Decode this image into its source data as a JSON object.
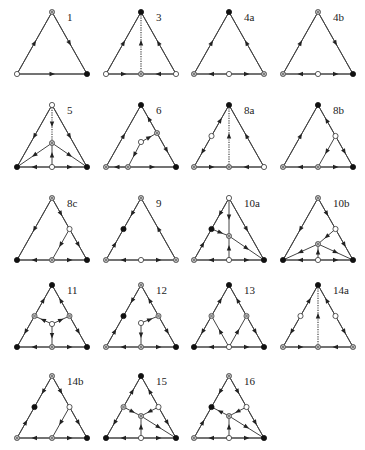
{
  "figure": {
    "legend": {
      "black": "filled circle",
      "white": "open circle",
      "gray": "crossed/shaded circle"
    },
    "colors": {
      "edge": "#444444",
      "black": "#111111",
      "white": "#ffffff",
      "gray": "#bbbbbb"
    },
    "layout": {
      "col_apex_x": [
        52,
        141,
        229,
        318
      ],
      "row_apex_y": [
        12,
        105,
        198,
        285,
        376
      ],
      "half_width": 35,
      "height": 62
    },
    "named_points": {
      "A": [
        0,
        0
      ],
      "L": [
        -35,
        62
      ],
      "R": [
        35,
        62
      ],
      "BM": [
        0,
        62
      ],
      "LM": [
        -17.5,
        31
      ],
      "RM": [
        17.5,
        31
      ]
    },
    "diagrams": [
      {
        "label": "1",
        "row": 0,
        "col": 0,
        "nodes": {
          "A": "gray",
          "L": "white",
          "R": "black"
        },
        "edges": [
          [
            "L",
            "A",
            false
          ],
          [
            "A",
            "R",
            false
          ],
          [
            "L",
            "R",
            false
          ]
        ]
      },
      {
        "label": "3",
        "row": 0,
        "col": 1,
        "nodes": {
          "A": "black",
          "L": "white",
          "R": "white",
          "BM": "gray"
        },
        "edges": [
          [
            "L",
            "A",
            false
          ],
          [
            "R",
            "A",
            false
          ],
          [
            "L",
            "BM",
            false
          ],
          [
            "R",
            "BM",
            false
          ],
          [
            "BM",
            "A",
            true
          ]
        ]
      },
      {
        "label": "4a",
        "row": 0,
        "col": 2,
        "nodes": {
          "A": "black",
          "L": "gray",
          "R": "gray",
          "BM": "white"
        },
        "edges": [
          [
            "L",
            "A",
            false
          ],
          [
            "R",
            "A",
            false
          ],
          [
            "BM",
            "L",
            false
          ],
          [
            "BM",
            "R",
            false
          ]
        ]
      },
      {
        "label": "4b",
        "row": 0,
        "col": 3,
        "nodes": {
          "A": "gray",
          "L": "gray",
          "R": "black",
          "BM": "white"
        },
        "edges": [
          [
            "L",
            "A",
            false
          ],
          [
            "A",
            "R",
            false
          ],
          [
            "BM",
            "L",
            false
          ],
          [
            "BM",
            "R",
            false
          ]
        ]
      },
      {
        "label": "5",
        "row": 1,
        "col": 0,
        "nodes": {
          "A": "white",
          "L": "black",
          "R": "black",
          "BM": "white",
          "C": "gray"
        },
        "points": {
          "C": [
            0,
            38
          ]
        },
        "edges": [
          [
            "A",
            "L",
            false
          ],
          [
            "A",
            "R",
            false
          ],
          [
            "BM",
            "L",
            false
          ],
          [
            "BM",
            "R",
            false
          ],
          [
            "A",
            "C",
            true
          ],
          [
            "BM",
            "C",
            false
          ],
          [
            "C",
            "L",
            false
          ],
          [
            "C",
            "R",
            false
          ]
        ]
      },
      {
        "label": "6",
        "row": 1,
        "col": 1,
        "nodes": {
          "A": "black",
          "L": "gray",
          "R": "black",
          "P": "gray",
          "Q": "white",
          "S": "gray"
        },
        "points": {
          "P": [
            16,
            28
          ],
          "Q": [
            0,
            37
          ],
          "S": [
            -13,
            62
          ]
        },
        "edges": [
          [
            "L",
            "A",
            false
          ],
          [
            "P",
            "A",
            false
          ],
          [
            "P",
            "R",
            false
          ],
          [
            "S",
            "L",
            false
          ],
          [
            "S",
            "R",
            false
          ],
          [
            "Q",
            "P",
            false
          ],
          [
            "Q",
            "S",
            false
          ]
        ]
      },
      {
        "label": "8a",
        "row": 1,
        "col": 2,
        "nodes": {
          "A": "black",
          "L": "gray",
          "R": "white",
          "LM": "white",
          "BM": "gray"
        },
        "edges": [
          [
            "LM",
            "A",
            false
          ],
          [
            "LM",
            "L",
            false
          ],
          [
            "R",
            "A",
            false
          ],
          [
            "L",
            "BM",
            false
          ],
          [
            "R",
            "BM",
            false
          ],
          [
            "BM",
            "A",
            true
          ]
        ]
      },
      {
        "label": "8b",
        "row": 1,
        "col": 3,
        "nodes": {
          "A": "black",
          "L": "gray",
          "R": "black",
          "RM": "white",
          "S": "gray"
        },
        "points": {
          "S": [
            0,
            62
          ]
        },
        "edges": [
          [
            "L",
            "A",
            false
          ],
          [
            "RM",
            "A",
            false
          ],
          [
            "RM",
            "R",
            false
          ],
          [
            "S",
            "L",
            false
          ],
          [
            "S",
            "R",
            false
          ],
          [
            "RM",
            "S",
            false
          ]
        ]
      },
      {
        "label": "8c",
        "row": 2,
        "col": 0,
        "nodes": {
          "A": "gray",
          "L": "black",
          "R": "black",
          "RM": "white",
          "BM": "gray"
        },
        "edges": [
          [
            "A",
            "L",
            false
          ],
          [
            "A",
            "RM",
            false
          ],
          [
            "RM",
            "R",
            false
          ],
          [
            "BM",
            "L",
            false
          ],
          [
            "BM",
            "R",
            false
          ],
          [
            "RM",
            "BM",
            false
          ]
        ]
      },
      {
        "label": "9",
        "row": 2,
        "col": 1,
        "nodes": {
          "A": "gray",
          "L": "gray",
          "R": "gray",
          "LM": "black",
          "BM": "white"
        },
        "edges": [
          [
            "A",
            "LM",
            false
          ],
          [
            "L",
            "LM",
            false
          ],
          [
            "R",
            "A",
            false
          ],
          [
            "BM",
            "L",
            false
          ],
          [
            "BM",
            "R",
            false
          ]
        ]
      },
      {
        "label": "10a",
        "row": 2,
        "col": 2,
        "nodes": {
          "A": "white",
          "L": "gray",
          "R": "black",
          "LM": "black",
          "BM": "white",
          "C": "gray"
        },
        "points": {
          "C": [
            0,
            38
          ]
        },
        "edges": [
          [
            "A",
            "LM",
            false
          ],
          [
            "L",
            "LM",
            false
          ],
          [
            "A",
            "R",
            false
          ],
          [
            "BM",
            "L",
            false
          ],
          [
            "BM",
            "R",
            false
          ],
          [
            "A",
            "C",
            false
          ],
          [
            "BM",
            "C",
            false
          ],
          [
            "LM",
            "C",
            false
          ],
          [
            "C",
            "R",
            false
          ]
        ]
      },
      {
        "label": "10b",
        "row": 2,
        "col": 3,
        "nodes": {
          "A": "gray",
          "L": "black",
          "R": "black",
          "RM": "white",
          "BM": "white",
          "C": "gray"
        },
        "points": {
          "C": [
            0,
            46
          ]
        },
        "edges": [
          [
            "A",
            "L",
            false
          ],
          [
            "A",
            "RM",
            false
          ],
          [
            "RM",
            "R",
            false
          ],
          [
            "BM",
            "L",
            false
          ],
          [
            "BM",
            "R",
            false
          ],
          [
            "RM",
            "C",
            false
          ],
          [
            "BM",
            "C",
            false
          ],
          [
            "C",
            "L",
            false
          ],
          [
            "C",
            "R",
            false
          ]
        ]
      },
      {
        "label": "11",
        "row": 3,
        "col": 0,
        "nodes": {
          "A": "black",
          "L": "black",
          "R": "black",
          "LM": "gray",
          "RM": "gray",
          "BM": "gray",
          "C": "white"
        },
        "points": {
          "C": [
            0,
            39
          ]
        },
        "edges": [
          [
            "LM",
            "A",
            false
          ],
          [
            "LM",
            "L",
            false
          ],
          [
            "RM",
            "A",
            false
          ],
          [
            "RM",
            "R",
            false
          ],
          [
            "BM",
            "L",
            false
          ],
          [
            "BM",
            "R",
            false
          ],
          [
            "C",
            "LM",
            false
          ],
          [
            "C",
            "RM",
            false
          ],
          [
            "C",
            "BM",
            false
          ]
        ]
      },
      {
        "label": "12",
        "row": 3,
        "col": 1,
        "nodes": {
          "A": "gray",
          "L": "gray",
          "R": "black",
          "LM": "black",
          "RM": "gray",
          "BM": "gray",
          "C": "white"
        },
        "points": {
          "C": [
            0,
            38
          ]
        },
        "edges": [
          [
            "A",
            "LM",
            false
          ],
          [
            "L",
            "LM",
            false
          ],
          [
            "RM",
            "A",
            false
          ],
          [
            "RM",
            "R",
            false
          ],
          [
            "BM",
            "L",
            false
          ],
          [
            "BM",
            "R",
            false
          ],
          [
            "C",
            "RM",
            false
          ],
          [
            "C",
            "BM",
            false
          ]
        ]
      },
      {
        "label": "13",
        "row": 3,
        "col": 2,
        "nodes": {
          "A": "black",
          "L": "black",
          "R": "black",
          "LM": "gray",
          "RM": "gray",
          "BM": "white"
        },
        "edges": [
          [
            "LM",
            "A",
            false
          ],
          [
            "LM",
            "L",
            false
          ],
          [
            "RM",
            "A",
            false
          ],
          [
            "RM",
            "R",
            false
          ],
          [
            "BM",
            "L",
            false
          ],
          [
            "BM",
            "R",
            false
          ],
          [
            "BM",
            "LM",
            false
          ],
          [
            "BM",
            "RM",
            false
          ]
        ]
      },
      {
        "label": "14a",
        "row": 3,
        "col": 3,
        "nodes": {
          "A": "black",
          "L": "gray",
          "R": "gray",
          "LM": "white",
          "RM": "white",
          "BM": "gray"
        },
        "edges": [
          [
            "LM",
            "A",
            false
          ],
          [
            "LM",
            "L",
            false
          ],
          [
            "RM",
            "A",
            false
          ],
          [
            "RM",
            "R",
            false
          ],
          [
            "L",
            "BM",
            false
          ],
          [
            "R",
            "BM",
            false
          ],
          [
            "BM",
            "A",
            true
          ]
        ]
      },
      {
        "label": "14b",
        "row": 4,
        "col": 0,
        "nodes": {
          "A": "gray",
          "L": "gray",
          "R": "black",
          "LM": "black",
          "RM": "white",
          "BM": "gray"
        },
        "edges": [
          [
            "A",
            "LM",
            false
          ],
          [
            "L",
            "LM",
            false
          ],
          [
            "A",
            "RM",
            false
          ],
          [
            "RM",
            "R",
            false
          ],
          [
            "BM",
            "L",
            false
          ],
          [
            "BM",
            "R",
            false
          ],
          [
            "RM",
            "BM",
            false
          ]
        ]
      },
      {
        "label": "15",
        "row": 4,
        "col": 1,
        "nodes": {
          "A": "black",
          "L": "black",
          "R": "black",
          "LM": "gray",
          "RM": "white",
          "BM": "white",
          "C": "gray"
        },
        "points": {
          "C": [
            0,
            40
          ]
        },
        "edges": [
          [
            "LM",
            "A",
            false
          ],
          [
            "LM",
            "L",
            false
          ],
          [
            "RM",
            "A",
            false
          ],
          [
            "RM",
            "R",
            false
          ],
          [
            "BM",
            "L",
            false
          ],
          [
            "BM",
            "R",
            false
          ],
          [
            "LM",
            "C",
            false
          ],
          [
            "RM",
            "C",
            false
          ],
          [
            "BM",
            "C",
            false
          ],
          [
            "C",
            "R",
            false
          ]
        ]
      },
      {
        "label": "16",
        "row": 4,
        "col": 2,
        "nodes": {
          "A": "gray",
          "L": "gray",
          "R": "black",
          "LM": "black",
          "RM": "white",
          "BM": "white",
          "C": "gray"
        },
        "points": {
          "C": [
            0,
            40
          ]
        },
        "edges": [
          [
            "A",
            "LM",
            false
          ],
          [
            "L",
            "LM",
            false
          ],
          [
            "A",
            "RM",
            false
          ],
          [
            "RM",
            "R",
            false
          ],
          [
            "BM",
            "L",
            false
          ],
          [
            "BM",
            "R",
            false
          ],
          [
            "C",
            "LM",
            false
          ],
          [
            "RM",
            "C",
            false
          ],
          [
            "BM",
            "C",
            false
          ],
          [
            "C",
            "R",
            false
          ]
        ]
      }
    ]
  }
}
